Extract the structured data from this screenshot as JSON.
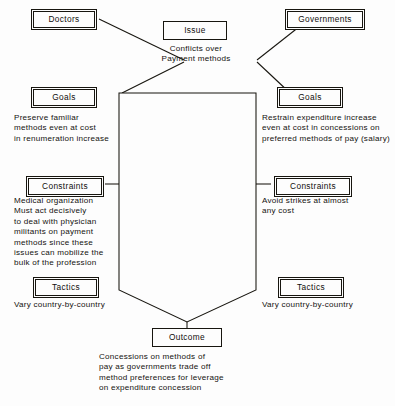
{
  "diagram": {
    "type": "conflict-analysis-flow",
    "actors": {
      "left_actor": "Doctors",
      "right_actor": "Governments"
    },
    "issue": {
      "label": "Issue",
      "text_line_1": "Conflicts over",
      "text_line_2": "Payment methods"
    },
    "left_column": {
      "goals": {
        "label": "Goals",
        "text": "Preserve familiar\nmethods even at cost\nin renumeration increase"
      },
      "constraints": {
        "label": "Constraints",
        "text": "Medical organization\nMust act decisively\nto deal with physician\nmilitants  on payment\nmethods since these\nissues can mobilize the\nbulk of the profession"
      },
      "tactics": {
        "label": "Tactics",
        "text": "Vary country-by-country"
      }
    },
    "right_column": {
      "goals": {
        "label": "Goals",
        "text": "Restrain expenditure increase\neven at cost in concessions on\npreferred methods of pay (salary)"
      },
      "constraints": {
        "label": "Constraints",
        "text": "Avoid strikes at almost\nany cost"
      },
      "tactics": {
        "label": "Tactics",
        "text": "Vary country-by-country"
      }
    },
    "outcome": {
      "label": "Outcome",
      "text": "Concessions on methods of\npay as governments trade off\nmethod preferences for leverage\non expenditure concession"
    },
    "colors": {
      "ink": "#17150f",
      "paper": "#fdfdfd"
    }
  }
}
